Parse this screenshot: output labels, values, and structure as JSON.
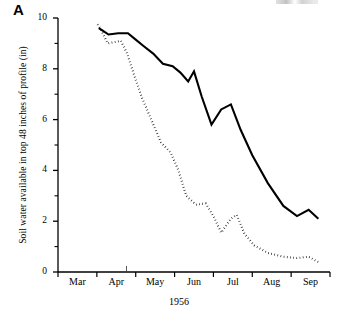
{
  "figure": {
    "panel_letter": "A",
    "ylabel": "Soil water available in top 48 inches of profile (in)",
    "xlabel": "1956"
  },
  "chart_data": {
    "type": "line",
    "title": "",
    "subtitle": "",
    "panel_label": "A",
    "xlabel": "1956",
    "ylabel": "Soil water available in top 48 inches of profile (in)",
    "ylim": [
      0,
      10
    ],
    "ytick_values": [
      0,
      2,
      4,
      6,
      8,
      10
    ],
    "ytick_labels": [
      "0",
      "2",
      "4",
      "6",
      "8",
      "10"
    ],
    "yminor_tick_values": [
      1,
      3,
      5,
      7,
      9
    ],
    "grid": false,
    "legend_position": "none",
    "x_axis": {
      "type": "category-interval",
      "tick_months": [
        "Mar",
        "Apr",
        "May",
        "Jun",
        "Jul",
        "Aug",
        "Sep"
      ],
      "tick_label_position": "between-ticks",
      "xlim_months": [
        3.0,
        10.0
      ]
    },
    "xtick_labels": [
      "Mar",
      "Apr",
      "May",
      "Jun",
      "Jul",
      "Aug",
      "Sep"
    ],
    "series": [
      {
        "name": "solid-line",
        "style": "solid",
        "color": "#000000",
        "x_months": [
          4.05,
          4.15,
          4.3,
          4.55,
          4.8,
          5.0,
          5.2,
          5.45,
          5.7,
          5.95,
          6.15,
          6.35,
          6.5,
          6.7,
          6.95,
          7.2,
          7.45,
          7.7,
          8.0,
          8.4,
          8.8,
          9.15,
          9.45,
          9.7
        ],
        "values": [
          9.6,
          9.5,
          9.35,
          9.4,
          9.4,
          9.15,
          8.9,
          8.6,
          8.2,
          8.1,
          7.85,
          7.5,
          7.9,
          6.9,
          5.8,
          6.4,
          6.6,
          5.6,
          4.6,
          3.5,
          2.6,
          2.2,
          2.45,
          2.1
        ]
      },
      {
        "name": "dotted-line",
        "style": "dotted",
        "color": "#000000",
        "x_months": [
          4.02,
          4.12,
          4.28,
          4.45,
          4.62,
          4.78,
          4.95,
          5.15,
          5.4,
          5.65,
          5.9,
          6.1,
          6.3,
          6.55,
          6.8,
          7.0,
          7.2,
          7.45,
          7.6,
          7.8,
          8.05,
          8.4,
          8.8,
          9.15,
          9.45,
          9.75
        ],
        "values": [
          9.75,
          9.5,
          9.0,
          9.05,
          9.1,
          8.6,
          7.8,
          6.9,
          6.0,
          5.1,
          4.7,
          4.0,
          3.0,
          2.65,
          2.7,
          2.2,
          1.55,
          2.1,
          2.25,
          1.5,
          1.05,
          0.75,
          0.6,
          0.55,
          0.6,
          0.35
        ]
      }
    ]
  },
  "axis_geometry": {
    "plot_left_px": 58,
    "plot_right_px": 330,
    "plot_top_px": 18,
    "plot_bottom_px": 272
  }
}
